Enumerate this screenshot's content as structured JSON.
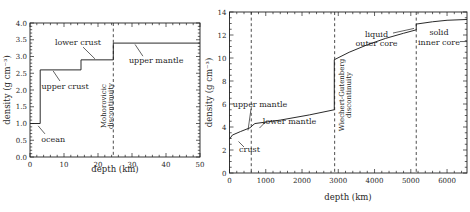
{
  "figure": {
    "background": "#ffffff",
    "ink": "#1f1f1f"
  },
  "chart_data": [
    {
      "id": "crust-density-chart",
      "type": "line",
      "line_type": "step",
      "xlabel": "depth (km)",
      "ylabel": "density (g cm⁻³)",
      "xlim": [
        0,
        50
      ],
      "ylim": [
        0,
        4
      ],
      "xticks": {
        "step": 10,
        "minorStep": 2,
        "decimals": 0
      },
      "yticks": {
        "step": 0.5,
        "minorStep": 0.1,
        "decimals": 1
      },
      "series": [
        {
          "name": "density-profile",
          "points": [
            [
              0,
              1.0
            ],
            [
              3,
              1.0
            ],
            [
              3,
              2.6
            ],
            [
              15,
              2.6
            ],
            [
              15,
              2.9
            ],
            [
              24.5,
              2.9
            ],
            [
              24.5,
              3.4
            ],
            [
              50,
              3.4
            ]
          ]
        }
      ],
      "vlines": [
        24.5
      ],
      "annotations": [
        {
          "lines": [
            "lower crust"
          ],
          "x": 14.1,
          "y": 3.42,
          "rotated": false
        },
        {
          "lines": [
            "upper crust"
          ],
          "x": 10.3,
          "y": 2.12,
          "rotated": false
        },
        {
          "lines": [
            "upper mantle"
          ],
          "x": 37.1,
          "y": 2.9,
          "rotated": false
        },
        {
          "lines": [
            "ocean"
          ],
          "x": 6.8,
          "y": 0.54,
          "rotated": false
        },
        {
          "lines": [
            "Mohorovicic",
            "discontinuity"
          ],
          "x": 22.6,
          "y": 1.52,
          "rotated": true
        }
      ],
      "leaders": [
        [
          15.6,
          3.28,
          19.1,
          2.93
        ],
        [
          6.8,
          2.57,
          8.8,
          2.27
        ],
        [
          30.9,
          3.36,
          33.2,
          3.01
        ],
        [
          2.4,
          0.93,
          4.4,
          0.69
        ]
      ]
    },
    {
      "id": "earth-interior-density-chart",
      "type": "line",
      "line_type": "line",
      "xlabel": "depth (km)",
      "ylabel": "density (g cm⁻³)",
      "xlim": [
        0,
        6550
      ],
      "ylim": [
        0,
        14
      ],
      "xticks": {
        "step": 1000,
        "minorStep": 200,
        "decimals": 0
      },
      "yticks": {
        "step": 2,
        "minorStep": 0.5,
        "decimals": 0
      },
      "series": [
        {
          "name": "density-profile",
          "points": [
            [
              0,
              2.95
            ],
            [
              80,
              3.3
            ],
            [
              300,
              3.6
            ],
            [
              580,
              3.95
            ],
            [
              620,
              4.1
            ],
            [
              700,
              4.3
            ],
            [
              1400,
              4.6
            ],
            [
              2200,
              5.05
            ],
            [
              2890,
              5.5
            ],
            [
              2890,
              9.85
            ],
            [
              3300,
              10.5
            ],
            [
              3800,
              11.15
            ],
            [
              4300,
              11.7
            ],
            [
              4800,
              12.15
            ],
            [
              5150,
              12.45
            ],
            [
              5150,
              12.95
            ],
            [
              5600,
              13.15
            ],
            [
              6000,
              13.28
            ],
            [
              6550,
              13.35
            ]
          ]
        }
      ],
      "vlines": [
        600,
        2900,
        5150
      ],
      "annotations": [
        {
          "lines": [
            "upper mantle"
          ],
          "x": 841,
          "y": 5.96,
          "rotated": false
        },
        {
          "lines": [
            "lower mantle"
          ],
          "x": 1655,
          "y": 4.48,
          "rotated": false
        },
        {
          "lines": [
            "crust"
          ],
          "x": 552,
          "y": 2.04,
          "rotated": false
        },
        {
          "lines": [
            "liquid",
            "outer core"
          ],
          "x": 4054,
          "y": 11.7,
          "rotated": false
        },
        {
          "lines": [
            "solid",
            "inner core"
          ],
          "x": 5777,
          "y": 11.83,
          "rotated": false
        },
        {
          "lines": [
            "Wiechert-Gutenberg",
            "discontinuity"
          ],
          "x": 3185,
          "y": 6.78,
          "rotated": true
        }
      ],
      "leaders": [
        [
          593,
          5.57,
          510,
          3.7
        ],
        [
          1007,
          4.48,
          827,
          3.91
        ],
        [
          248,
          2.74,
          400,
          2.26
        ],
        [
          4509,
          12.17,
          5088,
          12.57
        ],
        [
          6357,
          11.43,
          6550,
          11.43
        ]
      ]
    }
  ]
}
